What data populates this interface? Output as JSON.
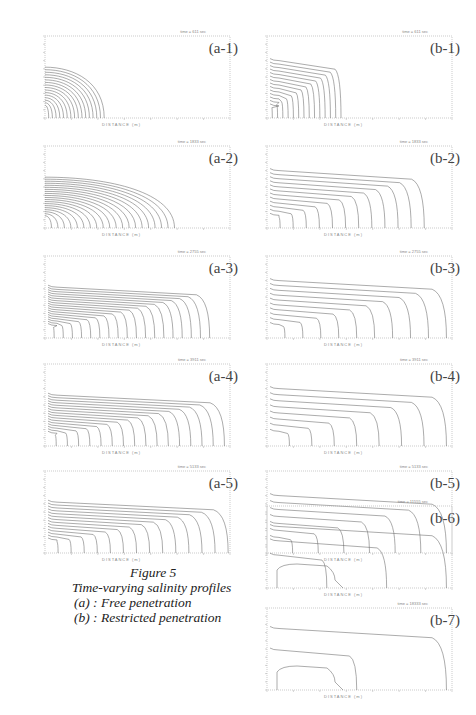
{
  "caption": {
    "title": "Figure 5",
    "subtitle": "Time-varying salinity profiles",
    "legend_a": "(a) : Free penetration",
    "legend_b": "(b) : Restricted penetration"
  },
  "axes": {
    "xlabel": "DISTANCE (m)",
    "ylabel": "DIMENSIONLESS DEPTH"
  },
  "panels": [
    {
      "id": "a-1",
      "label": "(a-1)",
      "time": "time = 611 sec",
      "reach": 0.32,
      "n": 16
    },
    {
      "id": "a-2",
      "label": "(a-2)",
      "time": "time = 1833 sec",
      "reach": 0.7,
      "n": 20
    },
    {
      "id": "a-3",
      "label": "(a-3)",
      "time": "time = 2755 sec",
      "reach": 0.89,
      "n": 18
    },
    {
      "id": "a-4",
      "label": "(a-4)",
      "time": "time = 3911 sec",
      "reach": 0.97,
      "n": 16
    },
    {
      "id": "a-5",
      "label": "(a-5)",
      "time": "time = 5133 sec",
      "reach": 0.99,
      "n": 14
    },
    {
      "id": "b-1",
      "label": "(b-1)",
      "time": "time = 611 sec",
      "reach": 0.4,
      "n": 14
    },
    {
      "id": "b-2",
      "label": "(b-2)",
      "time": "time = 1833 sec",
      "reach": 0.85,
      "n": 12
    },
    {
      "id": "b-3",
      "label": "(b-3)",
      "time": "time = 2755 sec",
      "reach": 0.97,
      "n": 10
    },
    {
      "id": "b-4",
      "label": "(b-4)",
      "time": "time = 3911 sec",
      "reach": 0.97,
      "n": 8
    },
    {
      "id": "b-5",
      "label": "(b-5)",
      "time": "time = 5133 sec",
      "reach": 0.97,
      "n": 7
    },
    {
      "id": "b-6",
      "label": "(b-6)",
      "time": "time = 11555 sec",
      "reach": 0.97,
      "n": 3
    },
    {
      "id": "b-7",
      "label": "(b-7)",
      "time": "time = 18333 sec",
      "reach": 0.97,
      "n": 2
    }
  ]
}
